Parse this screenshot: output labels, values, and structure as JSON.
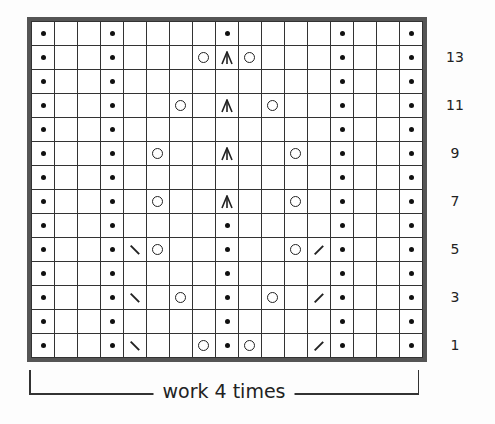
{
  "chart": {
    "columns": 17,
    "rows_count": 14,
    "legend_symbols": {
      ".": "purl (dot)",
      "o": "yarn over (circle)",
      "^": "centered double decrease",
      "\\": "ssk / left-leaning decrease",
      "/": "k2tog / right-leaning decrease",
      "_": "knit (blank)"
    },
    "rows": [
      {
        "num": 14,
        "cells": [
          ".",
          "_",
          "_",
          ".",
          "_",
          "_",
          "_",
          "_",
          ".",
          "_",
          "_",
          "_",
          "_",
          ".",
          "_",
          "_",
          "."
        ]
      },
      {
        "num": 13,
        "cells": [
          ".",
          "_",
          "_",
          ".",
          "_",
          "_",
          "_",
          "o",
          "^",
          "o",
          "_",
          "_",
          "_",
          ".",
          "_",
          "_",
          "."
        ]
      },
      {
        "num": 12,
        "cells": [
          ".",
          "_",
          "_",
          ".",
          "_",
          "_",
          "_",
          "_",
          "_",
          "_",
          "_",
          "_",
          "_",
          ".",
          "_",
          "_",
          "."
        ]
      },
      {
        "num": 11,
        "cells": [
          ".",
          "_",
          "_",
          ".",
          "_",
          "_",
          "o",
          "_",
          "^",
          "_",
          "o",
          "_",
          "_",
          ".",
          "_",
          "_",
          "."
        ]
      },
      {
        "num": 10,
        "cells": [
          ".",
          "_",
          "_",
          ".",
          "_",
          "_",
          "_",
          "_",
          "_",
          "_",
          "_",
          "_",
          "_",
          ".",
          "_",
          "_",
          "."
        ]
      },
      {
        "num": 9,
        "cells": [
          ".",
          "_",
          "_",
          ".",
          "_",
          "o",
          "_",
          "_",
          "^",
          "_",
          "_",
          "o",
          "_",
          ".",
          "_",
          "_",
          "."
        ]
      },
      {
        "num": 8,
        "cells": [
          ".",
          "_",
          "_",
          ".",
          "_",
          "_",
          "_",
          "_",
          "_",
          "_",
          "_",
          "_",
          "_",
          ".",
          "_",
          "_",
          "."
        ]
      },
      {
        "num": 7,
        "cells": [
          ".",
          "_",
          "_",
          ".",
          "_",
          "o",
          "_",
          "_",
          "^",
          "_",
          "_",
          "o",
          "_",
          ".",
          "_",
          "_",
          "."
        ]
      },
      {
        "num": 6,
        "cells": [
          ".",
          "_",
          "_",
          ".",
          "_",
          "_",
          "_",
          "_",
          ".",
          "_",
          "_",
          "_",
          "_",
          ".",
          "_",
          "_",
          "."
        ]
      },
      {
        "num": 5,
        "cells": [
          ".",
          "_",
          "_",
          ".",
          "\\",
          "o",
          "_",
          "_",
          ".",
          "_",
          "_",
          "o",
          "/",
          ".",
          "_",
          "_",
          "."
        ]
      },
      {
        "num": 4,
        "cells": [
          ".",
          "_",
          "_",
          ".",
          "_",
          "_",
          "_",
          "_",
          ".",
          "_",
          "_",
          "_",
          "_",
          ".",
          "_",
          "_",
          "."
        ]
      },
      {
        "num": 3,
        "cells": [
          ".",
          "_",
          "_",
          ".",
          "\\",
          "_",
          "o",
          "_",
          ".",
          "_",
          "o",
          "_",
          "/",
          ".",
          "_",
          "_",
          "."
        ]
      },
      {
        "num": 2,
        "cells": [
          ".",
          "_",
          "_",
          ".",
          "_",
          "_",
          "_",
          "_",
          ".",
          "_",
          "_",
          "_",
          "_",
          ".",
          "_",
          "_",
          "."
        ]
      },
      {
        "num": 1,
        "cells": [
          ".",
          "_",
          "_",
          ".",
          "\\",
          "_",
          "_",
          "o",
          ".",
          "o",
          "_",
          "_",
          "/",
          ".",
          "_",
          "_",
          "."
        ]
      }
    ],
    "row_labels": [
      "13",
      "11",
      "9",
      "7",
      "5",
      "3",
      "1"
    ],
    "repeat_label": "work 4 times"
  }
}
